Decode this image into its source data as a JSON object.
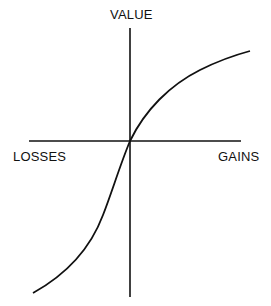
{
  "diagram": {
    "labels": {
      "y_axis": "VALUE",
      "x_negative": "LOSSES",
      "x_positive": "GAINS"
    },
    "colors": {
      "line": "#111111",
      "background": "#ffffff"
    },
    "curve": {
      "shape": "S-shaped value function: concave for gains, convex and steeper for losses",
      "passes_through_origin": true
    }
  }
}
